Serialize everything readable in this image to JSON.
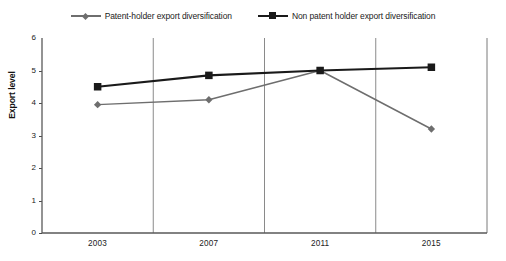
{
  "chart_data": {
    "type": "line",
    "title": "",
    "subtitle": "",
    "xlabel": "",
    "ylabel": "Export level",
    "categories": [
      "2003",
      "2007",
      "2011",
      "2015"
    ],
    "ylim": [
      0,
      6
    ],
    "yticks": [
      "0",
      "1",
      "2",
      "3",
      "4",
      "5",
      "6"
    ],
    "grid": "vertical-category-boundaries",
    "legend_position": "top-center",
    "series": [
      {
        "name": "Patent-holder export diversification",
        "values": [
          3.95,
          4.1,
          5.0,
          3.2
        ],
        "color": "#6e6e6e",
        "marker": "diamond"
      },
      {
        "name": "Non patent holder export diversification",
        "values": [
          4.5,
          4.85,
          5.0,
          5.1
        ],
        "color": "#1a1a1a",
        "marker": "square"
      }
    ]
  },
  "axes": {
    "y_axis_line_color": "#595959",
    "x_axis_line_color": "#595959",
    "grid_line_color": "#8a8a8a",
    "right_border_color": "#7a7a7a"
  },
  "legend": {
    "entries": [
      {
        "label": "Patent-holder export diversification"
      },
      {
        "label": "Non patent holder export diversification"
      }
    ]
  }
}
